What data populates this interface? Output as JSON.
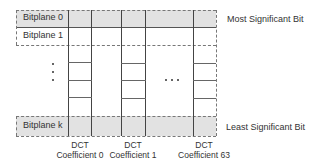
{
  "diagram": {
    "bitplanes": [
      {
        "label": "Bitplane 0",
        "shaded": true
      },
      {
        "label": "Bitplane 1",
        "shaded": false
      },
      {
        "label": "Bitplane k",
        "shaded": true
      }
    ],
    "columns": [
      {
        "line1": "DCT",
        "line2": "Coefficient 0"
      },
      {
        "line1": "DCT",
        "line2": "Coefficient 1"
      },
      {
        "line1": "DCT",
        "line2": "Coefficient 63"
      }
    ],
    "ellipsis_vertical": "⋮",
    "ellipsis_horizontal": "...",
    "msb_label": "Most Significant Bit",
    "lsb_label": "Least Significant Bit",
    "colors": {
      "shade": "#e2e2e2",
      "line": "#444444",
      "dash": "#777777"
    }
  }
}
